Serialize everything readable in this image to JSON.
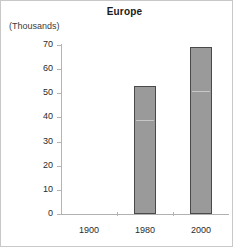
{
  "chart_data": {
    "type": "bar",
    "title": "Europe",
    "units_caption": "(Thousands)",
    "xlabel": "",
    "ylabel": "",
    "categories": [
      "1900",
      "1980",
      "2000"
    ],
    "values": [
      null,
      53,
      69
    ],
    "ylim": [
      0,
      70
    ],
    "ytick_step": 10,
    "yticks": [
      70,
      60,
      50,
      40,
      30,
      20,
      10,
      0
    ],
    "ytick_labels": [
      "70",
      "60",
      "50",
      "40",
      "30",
      "20",
      "10",
      "0"
    ],
    "grid": false,
    "legend": null,
    "series": [
      {
        "name": "Europe",
        "values": [
          null,
          53,
          69
        ]
      }
    ],
    "colors": {
      "bar_fill": "#9a9a9a",
      "bar_border": "#4a4a4a",
      "axis": "#b4b4b4",
      "text": "#2a2a2a",
      "background": "#ffffff"
    }
  }
}
